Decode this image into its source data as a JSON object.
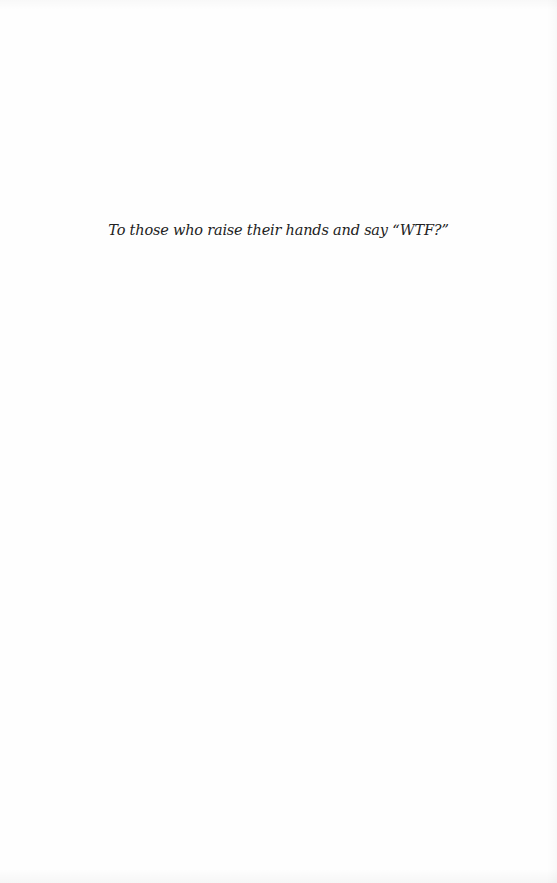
{
  "page": {
    "type": "dedication",
    "text": "To those who raise their hands and say “WTF?”",
    "colors": {
      "background": "#fefefe",
      "text": "#222222"
    }
  }
}
